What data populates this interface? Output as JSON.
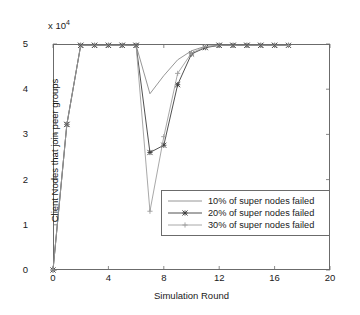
{
  "chart_data": {
    "type": "line",
    "title": "",
    "xlabel": "Simulation Round",
    "ylabel": "Client Nodes that join peer groups",
    "y_multiplier_text": "x 10",
    "y_multiplier_exponent": "4",
    "xlim": [
      0,
      20
    ],
    "ylim": [
      0,
      5
    ],
    "xticks": [
      0,
      4,
      8,
      12,
      16,
      20
    ],
    "xtick_labels": [
      "0",
      "4",
      "8",
      "12",
      "16",
      "20"
    ],
    "yticks": [
      0,
      1,
      2,
      3,
      4,
      5
    ],
    "ytick_labels": [
      "0",
      "1",
      "2",
      "3",
      "4",
      "5"
    ],
    "grid": false,
    "legend_position": "lower right",
    "series": [
      {
        "name": "10% of super nodes failed",
        "color": "#8a8a8a",
        "marker": "none",
        "x": [
          0,
          1,
          2,
          3,
          4,
          5,
          6,
          7,
          8,
          9,
          10,
          11,
          12,
          13,
          14,
          15,
          16,
          17
        ],
        "y": [
          0,
          3.22,
          4.97,
          4.97,
          4.97,
          4.97,
          4.97,
          3.9,
          4.3,
          4.65,
          4.85,
          4.95,
          4.97,
          4.97,
          4.97,
          4.97,
          4.97,
          4.97
        ]
      },
      {
        "name": "20% of super nodes failed",
        "color": "#3c3c3c",
        "marker": "star",
        "x": [
          0,
          1,
          2,
          3,
          4,
          5,
          6,
          7,
          8,
          9,
          10,
          11,
          12,
          13,
          14,
          15,
          16,
          17
        ],
        "y": [
          0,
          3.22,
          4.97,
          4.97,
          4.97,
          4.97,
          4.97,
          2.6,
          2.76,
          4.1,
          4.78,
          4.92,
          4.97,
          4.97,
          4.97,
          4.97,
          4.97,
          4.97
        ]
      },
      {
        "name": "30% of super nodes failed",
        "color": "#9e9e9e",
        "marker": "plus",
        "x": [
          0,
          1,
          2,
          3,
          4,
          5,
          6,
          7,
          8,
          9,
          10,
          11,
          12,
          13,
          14,
          15,
          16,
          17
        ],
        "y": [
          0,
          3.22,
          4.97,
          4.97,
          4.97,
          4.97,
          4.97,
          1.3,
          2.95,
          4.35,
          4.8,
          4.94,
          4.97,
          4.97,
          4.97,
          4.97,
          4.97,
          4.97
        ]
      }
    ]
  },
  "legend": {
    "items": [
      {
        "label": "10% of super nodes failed"
      },
      {
        "label": "20% of super nodes failed"
      },
      {
        "label": "30% of super nodes failed"
      }
    ]
  }
}
